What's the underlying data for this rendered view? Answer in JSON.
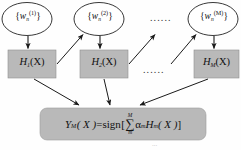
{
  "diagram": {
    "type": "flowchart",
    "background_color": "#fefefe",
    "node_fill_color": "#b9b9b9",
    "node_stroke_color": "#6f6f6f",
    "ellipse_fill_color": "#ffffff",
    "ellipse_stroke_color": "#222222",
    "arrow_color": "#1a1a1a",
    "weight_nodes": [
      {
        "id": "w1",
        "shape": "ellipse",
        "open_brace": "{",
        "symbol": "w",
        "subscript": "n",
        "superscript": "(1)",
        "close_brace": "}",
        "text": "{w_n^(1)}"
      },
      {
        "id": "w2",
        "shape": "ellipse",
        "open_brace": "{",
        "symbol": "w",
        "subscript": "n",
        "superscript": "(2)",
        "close_brace": "}",
        "text": "{w_n^(2)}"
      },
      {
        "id": "wM",
        "shape": "ellipse",
        "open_brace": "{",
        "symbol": "w",
        "subscript": "n",
        "superscript": "(M)",
        "close_brace": "}",
        "text": "{w_n^(M)}"
      }
    ],
    "classifier_nodes": [
      {
        "id": "h1",
        "shape": "rectangle",
        "symbol": "H",
        "subscript": "1",
        "argument": "(X)",
        "text": "H_1(X)"
      },
      {
        "id": "h2",
        "shape": "rectangle",
        "symbol": "H",
        "subscript": "2",
        "argument": "(X)",
        "text": "H_2(X)"
      },
      {
        "id": "hM",
        "shape": "rectangle",
        "symbol": "H",
        "subscript": "M",
        "argument": "(X)",
        "text": "H_M(X)"
      }
    ],
    "ellipsis_top": "......",
    "ellipsis_middle": "......",
    "output_node": {
      "id": "output",
      "shape": "rounded-rectangle",
      "lhs_symbol": "Y",
      "lhs_subscript": "M",
      "lhs_argument": "( X )",
      "equals": "=",
      "function": "sign",
      "bracket_open": "[",
      "sum_upper": "M",
      "sum_symbol": "∑",
      "sum_lower": "m",
      "alpha": "α",
      "alpha_subscript": "m",
      "term_symbol": "H",
      "term_subscript": "m",
      "term_argument": "( X )",
      "bracket_close": "]",
      "text": "Y_M(X)=sign[ Σ_m^M α_m H_m(X) ]"
    },
    "bottom_artifact": "..."
  }
}
